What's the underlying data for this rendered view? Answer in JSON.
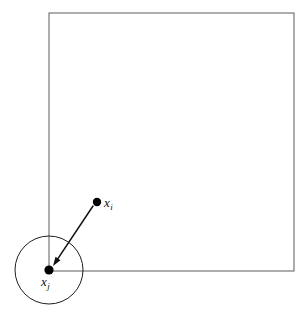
{
  "figure": {
    "type": "diagram",
    "title": "",
    "background_color": "#ffffff",
    "width": 308,
    "height": 324,
    "stroke_color": "#1a1a1a",
    "rect_stroke_color": "#6b6b6b",
    "point_color": "#000000",
    "elements": {
      "region_rectangle": {
        "name": "bounding-region",
        "x": 49,
        "y": 13,
        "width": 245,
        "height": 258,
        "stroke_width": 1
      },
      "neighborhood_circle": {
        "name": "neighborhood-circle",
        "cx": 49,
        "cy": 270,
        "r": 34,
        "stroke_width": 1
      },
      "point_i": {
        "name": "point-xi",
        "cx": 97,
        "cy": 202,
        "r": 4.2,
        "label": "x",
        "subscript": "i",
        "label_x": 104,
        "label_y": 196
      },
      "point_j": {
        "name": "point-xj",
        "cx": 49,
        "cy": 270,
        "r": 4.6,
        "label": "x",
        "subscript": "j",
        "label_x": 41,
        "label_y": 275
      },
      "arrow": {
        "name": "arrow-xi-to-xj",
        "x1": 93,
        "y1": 206,
        "x2": 53,
        "y2": 266,
        "stroke_width": 1.4,
        "head_length": 9,
        "head_width": 6
      }
    }
  }
}
